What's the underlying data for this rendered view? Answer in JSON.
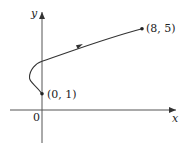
{
  "diagram": {
    "type": "parametric-curve",
    "axes": {
      "x_label": "x",
      "y_label": "y",
      "origin_label": "0"
    },
    "points": [
      {
        "label": "(0, 1)",
        "x": 0,
        "y": 1,
        "role": "start"
      },
      {
        "label": "(8, 5)",
        "x": 8,
        "y": 5,
        "role": "end"
      }
    ],
    "curve": {
      "equation": "x = y^2 - 4y + 3",
      "y_range": [
        1,
        5
      ],
      "direction": "from (0, 1) to (8, 5)"
    },
    "colors": {
      "axis": "#555555",
      "curve": "#333333",
      "text": "#222222"
    }
  }
}
